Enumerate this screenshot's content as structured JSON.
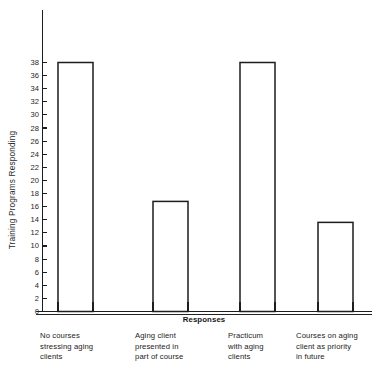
{
  "chart_data": {
    "type": "bar",
    "title": "",
    "subtitle": "",
    "xlabel": "Responses",
    "ylabel": "Training Programs Responding",
    "categories": [
      "No courses stressing aging clients",
      "Aging client presented in part of course",
      "Practicum with aging clients",
      "Courses on aging client as priority in future"
    ],
    "category_lines": [
      [
        "No courses",
        "stressing aging",
        "clients"
      ],
      [
        "Aging client",
        "presented in",
        "part of course"
      ],
      [
        "Practicum",
        "with aging",
        "clients"
      ],
      [
        "Courses on aging",
        "client as priority",
        "in future"
      ]
    ],
    "values": [
      38,
      16.8,
      38,
      13.6
    ],
    "ylim": [
      0,
      38
    ],
    "ytick_step": 2,
    "yticks": [
      0,
      2,
      4,
      6,
      8,
      10,
      12,
      14,
      16,
      18,
      20,
      22,
      24,
      26,
      28,
      30,
      32,
      34,
      36,
      38
    ],
    "ytick_labels": [
      "0",
      "2",
      "4",
      "6",
      "8",
      "10",
      "12",
      "14",
      "16",
      "18",
      "20",
      "22",
      "24",
      "26",
      "28",
      "30",
      "32",
      "34",
      "36",
      "38"
    ],
    "grid": false,
    "legend": false,
    "legend_position": "none",
    "bar_style": "outline",
    "bar_fill": "#ffffff",
    "bar_stroke": "#1d1d1d",
    "background": "#ffffff",
    "axis_color": "#1d1d1d"
  }
}
